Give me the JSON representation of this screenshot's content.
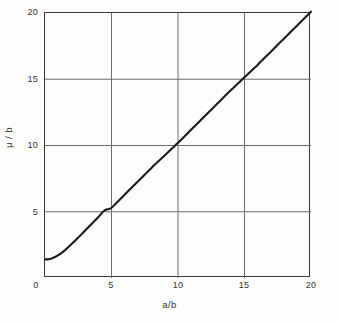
{
  "chart_data": {
    "type": "line",
    "title": "",
    "subtitle": "",
    "xlabel": "a/b",
    "ylabel": "μ / b",
    "xlim": [
      0,
      20
    ],
    "ylim": [
      0,
      20
    ],
    "xticks": [
      "0",
      "5",
      "10",
      "15",
      "20"
    ],
    "xtick_values": [
      0,
      5,
      10,
      15,
      20
    ],
    "yticks": [
      "0",
      "5",
      "10",
      "15",
      "20"
    ],
    "ytick_values": [
      0,
      5,
      10,
      15,
      20
    ],
    "grid": true,
    "grid_color": "#6d6d6d",
    "legend": "none",
    "series": [
      {
        "name": "μ / b vs a / b",
        "color": "#1a1a1a",
        "x": [
          0.0,
          0.25,
          0.5,
          0.75,
          1.0,
          1.25,
          1.5,
          2.0,
          2.5,
          3.0,
          3.5,
          4.0,
          4.5,
          5.0,
          6.0,
          7.0,
          8.0,
          9.0,
          10.0,
          11.0,
          12.0,
          13.0,
          14.0,
          15.0,
          16.0,
          17.0,
          18.0,
          19.0,
          20.0
        ],
        "y": [
          1.4,
          1.42,
          1.48,
          1.58,
          1.72,
          1.9,
          2.1,
          2.56,
          3.05,
          3.56,
          4.07,
          4.59,
          5.12,
          5.3,
          6.3,
          7.3,
          8.3,
          9.25,
          10.2,
          11.2,
          12.2,
          13.2,
          14.2,
          15.15,
          16.1,
          17.1,
          18.1,
          19.1,
          20.1
        ]
      }
    ],
    "annotations": []
  },
  "axes": {
    "x_title": "a/b",
    "y_title": "μ / b",
    "x_tick_labels": [
      "0",
      "5",
      "10",
      "15",
      "20"
    ],
    "y_tick_labels": [
      "0",
      "5",
      "10",
      "15",
      "20"
    ]
  }
}
